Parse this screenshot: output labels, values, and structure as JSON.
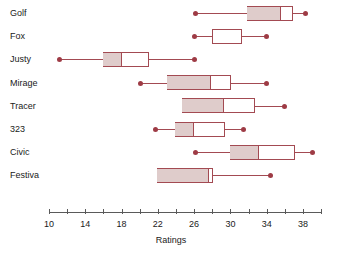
{
  "chart_data": {
    "type": "box",
    "title": "",
    "xlabel": "Ratings",
    "ylabel": "",
    "xlim": [
      9,
      40
    ],
    "grid": false,
    "legend": null,
    "orientation": "horizontal",
    "axis": {
      "tick_labels": [
        "10",
        "14",
        "18",
        "22",
        "26",
        "30",
        "34",
        "38"
      ],
      "tick_values": [
        10,
        14,
        18,
        22,
        26,
        30,
        34,
        38
      ],
      "minor_tick_values": [
        12,
        16,
        20,
        24,
        28,
        32,
        36,
        40
      ],
      "all_tick_values": [
        10,
        12,
        14,
        16,
        18,
        20,
        22,
        24,
        26,
        28,
        30,
        32,
        34,
        36,
        38,
        40
      ]
    },
    "categories": [
      "Golf",
      "Fox",
      "Justy",
      "Mirage",
      "Tracer",
      "323",
      "Civic",
      "Festiva"
    ],
    "boxes": [
      {
        "label": "Golf",
        "min": 26.1,
        "q1": 31.8,
        "median": 35.5,
        "q3": 36.9,
        "max": 38.3,
        "has_left_whisker": true,
        "has_right_whisker": true
      },
      {
        "label": "Fox",
        "min": 26.0,
        "q1": 28.0,
        "median": 28.0,
        "q3": 31.3,
        "max": 34.0,
        "has_left_whisker": true,
        "has_right_whisker": true
      },
      {
        "label": "Justy",
        "min": 11.2,
        "q1": 16.0,
        "median": 17.9,
        "q3": 21.0,
        "max": 26.0,
        "has_left_whisker": true,
        "has_right_whisker": true
      },
      {
        "label": "Mirage",
        "min": 20.1,
        "q1": 23.0,
        "median": 27.8,
        "q3": 30.1,
        "max": 34.0,
        "has_left_whisker": true,
        "has_right_whisker": true
      },
      {
        "label": "Tracer",
        "min": 24.7,
        "q1": 24.7,
        "median": 29.2,
        "q3": 32.7,
        "max": 36.0,
        "has_left_whisker": false,
        "has_right_whisker": true
      },
      {
        "label": "323",
        "min": 21.7,
        "q1": 23.9,
        "median": 25.9,
        "q3": 29.4,
        "max": 31.4,
        "has_left_whisker": true,
        "has_right_whisker": true
      },
      {
        "label": "Civic",
        "min": 26.1,
        "q1": 30.0,
        "median": 33.0,
        "q3": 37.1,
        "max": 39.0,
        "has_left_whisker": true,
        "has_right_whisker": true
      },
      {
        "label": "Festiva",
        "min": 21.9,
        "q1": 21.9,
        "median": 27.5,
        "q3": 28.1,
        "max": 34.4,
        "has_left_whisker": false,
        "has_right_whisker": true
      }
    ],
    "colors": {
      "box_outline": "#a34a52",
      "box_fill_lower": "#dfcccb",
      "box_fill_upper": "#ffffff",
      "whisker": "#a34a52",
      "cap_dot": "#9e3b45",
      "axis": "#5a5a5a",
      "text": "#1a1a1a",
      "background": "#ffffff"
    }
  }
}
